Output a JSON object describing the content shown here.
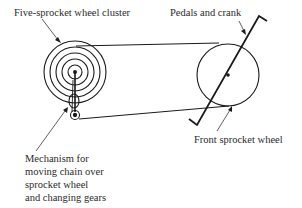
{
  "figure": {
    "labels": {
      "cluster": "Five-sprocket wheel cluster",
      "pedals": "Pedals and crank",
      "front": "Front sprocket wheel",
      "mechanism": [
        "Mechanism for",
        "moving chain over",
        "sprocket wheel",
        "and changing gears"
      ]
    },
    "components": {
      "rear_cluster": {
        "sprocket_count": 5
      },
      "front_sprocket": {
        "count": 1
      },
      "chain": "loop connecting rear cluster and front sprocket",
      "crank": "pedal crank through front sprocket center"
    },
    "line_color": "#1a1a1a"
  }
}
